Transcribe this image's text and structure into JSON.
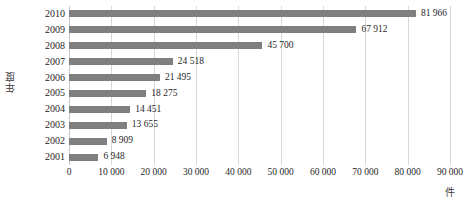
{
  "chart_data": {
    "type": "bar",
    "orientation": "horizontal",
    "title": "",
    "xlabel": "件",
    "ylabel": "年度",
    "categories": [
      "2010",
      "2009",
      "2008",
      "2007",
      "2006",
      "2005",
      "2004",
      "2003",
      "2002",
      "2001"
    ],
    "values": [
      81966,
      67912,
      45700,
      24518,
      21495,
      18275,
      14451,
      13655,
      8909,
      6948
    ],
    "value_labels": [
      "81 966",
      "67 912",
      "45 700",
      "24 518",
      "21 495",
      "18 275",
      "14 451",
      "13 655",
      "8 909",
      "6 948"
    ],
    "xlim": [
      0,
      90000
    ],
    "xticks": [
      0,
      10000,
      20000,
      30000,
      40000,
      50000,
      60000,
      70000,
      80000,
      90000
    ],
    "xtick_labels": [
      "0",
      "10 000",
      "20 000",
      "30 000",
      "40 000",
      "50 000",
      "60 000",
      "70 000",
      "80 000",
      "90 000"
    ],
    "grid": "vertical",
    "legend": "none",
    "bar_color": "#7f7f7f",
    "gridline_color": "#d9d9d9",
    "background_color": "#ffffff"
  }
}
